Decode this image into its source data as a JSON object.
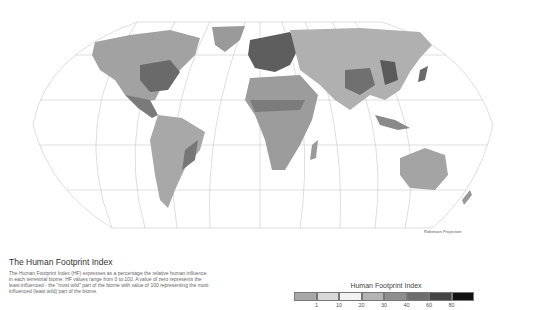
{
  "map": {
    "projection_label": "Robinson Projection",
    "background": "#ffffff",
    "graticule_color": "#b8b8b8"
  },
  "description": {
    "title": "The Human Footprint Index",
    "body": "The Human Footprint Index (HF) expresses as a percentage the relative human influence in each terrestrial biome. HF values range from 0 to 100. A value of zero represents the least influenced - the \"most wild\" part of the biome with value of 100 representing the most influenced (least wild) part of the biome."
  },
  "legend": {
    "title": "Human Footprint Index",
    "swatches": [
      {
        "range": "0-1",
        "color": "#a8a8a8"
      },
      {
        "range": "1-10",
        "color": "#d8d8d8"
      },
      {
        "range": "10-20",
        "color": "#f2f2f2"
      },
      {
        "range": "20-30",
        "color": "#b4b4b4"
      },
      {
        "range": "30-40",
        "color": "#8e8e8e"
      },
      {
        "range": "40-60",
        "color": "#6e6e6e"
      },
      {
        "range": "60-80",
        "color": "#444444"
      },
      {
        "range": "80-100",
        "color": "#111111"
      }
    ],
    "ticks": [
      "1",
      "10",
      "20",
      "30",
      "40",
      "60",
      "80"
    ]
  }
}
